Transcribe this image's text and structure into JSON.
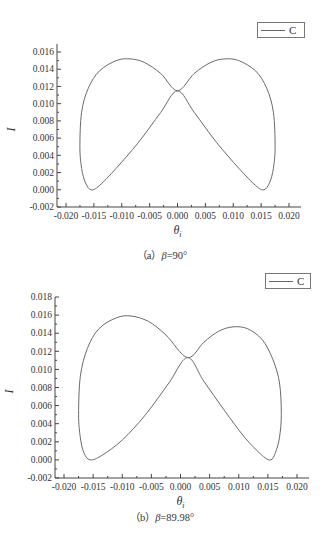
{
  "chart_data": [
    {
      "type": "line",
      "title": "",
      "caption_prefix": "（a）",
      "caption_symbol": "β",
      "caption_value": "=90°",
      "xlabel": "θi",
      "ylabel": "I",
      "xlim": [
        -0.02,
        0.022
      ],
      "ylim": [
        -0.002,
        0.0165
      ],
      "xticks": [
        "-0.020",
        "-0.015",
        "-0.010",
        "-0.005",
        "0.000",
        "0.005",
        "0.010",
        "0.015",
        "0.020"
      ],
      "yticks": [
        "-0.002",
        "0.000",
        "0.002",
        "0.004",
        "0.006",
        "0.008",
        "0.010",
        "0.012",
        "0.014",
        "0.016"
      ],
      "grid": false,
      "legend": {
        "entries": [
          "C"
        ],
        "position": "upper right"
      },
      "series": [
        {
          "name": "C",
          "x": [
            0.0,
            0.003,
            0.006,
            0.0085,
            0.011,
            0.014,
            0.016,
            0.0172,
            0.0175,
            0.0172,
            0.0165,
            0.0155,
            0.014,
            0.011,
            0.007,
            0.003,
            0.0,
            -0.003,
            -0.007,
            -0.011,
            -0.014,
            -0.0155,
            -0.0165,
            -0.0172,
            -0.0175,
            -0.0172,
            -0.016,
            -0.014,
            -0.011,
            -0.0085,
            -0.006,
            -0.003,
            0.0
          ],
          "y": [
            0.0115,
            0.0135,
            0.0148,
            0.0152,
            0.015,
            0.0138,
            0.0118,
            0.009,
            0.005,
            0.0025,
            0.0008,
            0.0,
            0.0005,
            0.0025,
            0.0055,
            0.009,
            0.0115,
            0.009,
            0.0055,
            0.0025,
            0.0005,
            0.0,
            0.0008,
            0.0025,
            0.005,
            0.009,
            0.0118,
            0.0138,
            0.015,
            0.0152,
            0.0148,
            0.0135,
            0.0115
          ]
        }
      ]
    },
    {
      "type": "line",
      "title": "",
      "caption_prefix": "（b）",
      "caption_symbol": "β",
      "caption_value": "=89.98°",
      "xlabel": "θi",
      "ylabel": "I",
      "xlim": [
        -0.02,
        0.022
      ],
      "ylim": [
        -0.002,
        0.018
      ],
      "xticks": [
        "-0.020",
        "-0.015",
        "-0.010",
        "-0.005",
        "0.000",
        "0.005",
        "0.010",
        "0.015",
        "0.020"
      ],
      "yticks": [
        "-0.002",
        "0.000",
        "0.002",
        "0.004",
        "0.006",
        "0.008",
        "0.010",
        "0.012",
        "0.014",
        "0.016",
        "0.018"
      ],
      "grid": false,
      "legend": {
        "entries": [
          "C"
        ],
        "position": "upper right"
      },
      "series": [
        {
          "name": "C",
          "x": [
            0.0012,
            0.004,
            0.0065,
            0.009,
            0.0115,
            0.014,
            0.0158,
            0.017,
            0.0173,
            0.017,
            0.0163,
            0.0155,
            0.014,
            0.011,
            0.0075,
            0.004,
            0.0012,
            -0.002,
            -0.006,
            -0.01,
            -0.0135,
            -0.0155,
            -0.0166,
            -0.0172,
            -0.0175,
            -0.0172,
            -0.016,
            -0.014,
            -0.011,
            -0.0085,
            -0.0055,
            -0.0025,
            0.0012
          ],
          "y": [
            0.0113,
            0.013,
            0.0142,
            0.0147,
            0.0145,
            0.0133,
            0.0112,
            0.0085,
            0.005,
            0.0025,
            0.0008,
            0.0,
            0.0005,
            0.0025,
            0.0055,
            0.0087,
            0.0113,
            0.0085,
            0.005,
            0.0022,
            0.0005,
            0.0,
            0.0008,
            0.0025,
            0.005,
            0.0092,
            0.0123,
            0.0145,
            0.0157,
            0.0159,
            0.0153,
            0.0138,
            0.0113
          ]
        }
      ]
    }
  ],
  "figures": [
    {
      "legend_label": "C",
      "caption_prefix": "（a）",
      "caption_symbol": "β",
      "caption_value": "=90°",
      "ylabel": "I",
      "xlabel_main": "θ",
      "xlabel_sub": "i"
    },
    {
      "legend_label": "C",
      "caption_prefix": "（b）",
      "caption_symbol": "β",
      "caption_value": "=89.98°",
      "ylabel": "I",
      "xlabel_main": "θ",
      "xlabel_sub": "i"
    }
  ],
  "colors": {
    "curve": "#6a6a6a",
    "axis": "#444444",
    "text": "#333333"
  }
}
